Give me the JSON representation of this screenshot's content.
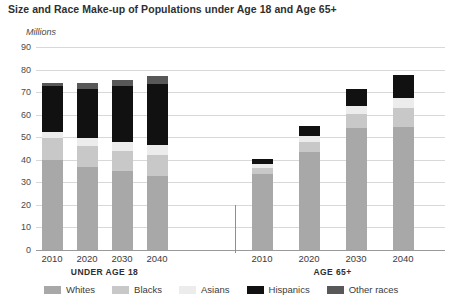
{
  "chart_data": {
    "type": "bar",
    "subtype": "stacked-bar-grouped",
    "title": "Size and Race Make-up of Populations under Age 18 and Age 65+",
    "xlabel": "",
    "ylabel": "Millions",
    "ylim": [
      0,
      90
    ],
    "ytick_step": 10,
    "yticks": [
      0,
      10,
      20,
      30,
      40,
      50,
      60,
      70,
      80,
      90
    ],
    "grid": true,
    "legend_position": "bottom",
    "categories": [
      "2010",
      "2020",
      "2030",
      "2040",
      "2010",
      "2020",
      "2030",
      "2040"
    ],
    "groups": [
      {
        "label": "UNDER AGE 18",
        "categories": [
          "2010",
          "2020",
          "2030",
          "2040"
        ]
      },
      {
        "label": "AGE 65+",
        "categories": [
          "2010",
          "2020",
          "2030",
          "2040"
        ]
      }
    ],
    "series": [
      {
        "name": "Whites",
        "color": "#a8a8a8",
        "values": [
          40.0,
          37.0,
          35.0,
          33.0,
          33.5,
          43.5,
          54.0,
          54.5
        ]
      },
      {
        "name": "Blacks",
        "color": "#c8c8c8",
        "values": [
          9.5,
          9.0,
          9.0,
          9.0,
          3.0,
          4.5,
          6.5,
          8.5
        ]
      },
      {
        "name": "Asians",
        "color": "#ececec",
        "values": [
          3.0,
          3.5,
          4.0,
          4.5,
          1.5,
          2.5,
          3.5,
          4.5
        ]
      },
      {
        "name": "Hispanics",
        "color": "#111111",
        "values": [
          20.0,
          22.0,
          24.5,
          27.0,
          2.5,
          4.5,
          7.5,
          10.0
        ]
      },
      {
        "name": "Other races",
        "color": "#585858",
        "values": [
          1.5,
          2.5,
          3.0,
          3.5,
          0.0,
          0.0,
          0.0,
          0.0
        ]
      }
    ],
    "totals": [
      74.0,
      74.0,
      75.5,
      77.0,
      40.5,
      55.0,
      71.5,
      77.5
    ]
  },
  "colors": {
    "grid": "#d8d8d8",
    "axis": "#9a9a9a",
    "text": "#3b3b3b",
    "title": "#2f2f2f"
  }
}
